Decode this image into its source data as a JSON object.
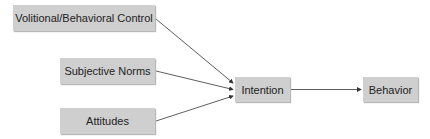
{
  "diagram": {
    "nodes": {
      "volitional": {
        "label": "Volitional/Behavioral Control"
      },
      "subjective": {
        "label": "Subjective Norms"
      },
      "attitudes": {
        "label": "Attitudes"
      },
      "intention": {
        "label": "Intention"
      },
      "behavior": {
        "label": "Behavior"
      }
    },
    "edges": [
      {
        "from": "Volitional/Behavioral Control",
        "to": "Intention"
      },
      {
        "from": "Subjective Norms",
        "to": "Intention"
      },
      {
        "from": "Attitudes",
        "to": "Intention"
      },
      {
        "from": "Intention",
        "to": "Behavior"
      }
    ],
    "colors": {
      "box_fill": "#cfcfcf",
      "line": "#333333"
    }
  }
}
